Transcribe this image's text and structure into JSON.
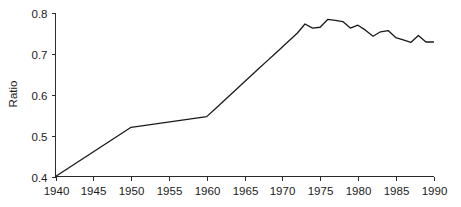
{
  "chart_data": {
    "type": "line",
    "title": "",
    "subtitle": "",
    "xlabel": "",
    "ylabel": "Ratio",
    "xlim": [
      1940,
      1990
    ],
    "ylim": [
      0.4,
      0.8
    ],
    "grid": false,
    "legend": "none",
    "x_ticks": [
      1940,
      1945,
      1950,
      1955,
      1960,
      1965,
      1970,
      1975,
      1980,
      1985,
      1990
    ],
    "x_tick_labels": [
      "1940",
      "1945",
      "1950",
      "1955",
      "1960",
      "1965",
      "1970",
      "1975",
      "1980",
      "1985",
      "1990"
    ],
    "y_ticks": [
      0.4,
      0.5,
      0.6,
      0.7,
      0.8
    ],
    "y_tick_labels": [
      "0.4",
      "0.5",
      "0.6",
      "0.7",
      "0.8"
    ],
    "line_color": "#1a1a1a",
    "series": [
      {
        "name": "Ratio",
        "x": [
          1940,
          1950,
          1960,
          1961,
          1962,
          1963,
          1964,
          1965,
          1966,
          1967,
          1968,
          1969,
          1970,
          1971,
          1972,
          1973,
          1974,
          1975,
          1976,
          1977,
          1978,
          1979,
          1980,
          1981,
          1982,
          1983,
          1984,
          1985,
          1986,
          1987,
          1988,
          1989,
          1990
        ],
        "values": [
          0.4,
          0.52,
          0.546,
          0.563,
          0.58,
          0.597,
          0.614,
          0.631,
          0.648,
          0.665,
          0.682,
          0.699,
          0.716,
          0.733,
          0.75,
          0.772,
          0.762,
          0.764,
          0.783,
          0.781,
          0.778,
          0.762,
          0.769,
          0.757,
          0.742,
          0.753,
          0.756,
          0.739,
          0.733,
          0.727,
          0.744,
          0.728,
          0.728
        ]
      }
    ]
  },
  "axes": {
    "ylabel": "Ratio"
  }
}
